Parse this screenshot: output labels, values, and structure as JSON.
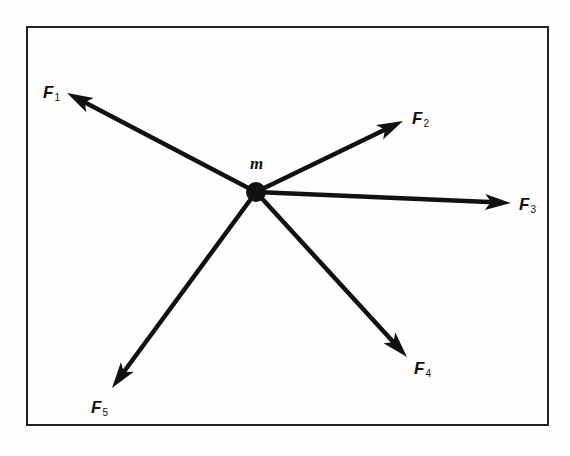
{
  "diagram": {
    "type": "force-diagram",
    "frame": {
      "left": 27,
      "top": 27,
      "right": 548,
      "bottom": 425
    },
    "mass": {
      "label": "m",
      "center": [
        256,
        192
      ],
      "radius": 10
    },
    "forces": [
      {
        "id": "F1",
        "symbol": "F",
        "subscript": "1",
        "tip": [
          67,
          93
        ],
        "label_pos": [
          43,
          84
        ]
      },
      {
        "id": "F2",
        "symbol": "F",
        "subscript": "2",
        "tip": [
          403,
          121
        ],
        "label_pos": [
          412,
          110
        ]
      },
      {
        "id": "F3",
        "symbol": "F",
        "subscript": "3",
        "tip": [
          511,
          203
        ],
        "label_pos": [
          519,
          196
        ]
      },
      {
        "id": "F4",
        "symbol": "F",
        "subscript": "4",
        "tip": [
          407,
          357
        ],
        "label_pos": [
          414,
          360
        ]
      },
      {
        "id": "F5",
        "symbol": "F",
        "subscript": "5",
        "tip": [
          112,
          388
        ],
        "label_pos": [
          91,
          399
        ]
      }
    ],
    "colors": {
      "ink": "#111111",
      "frame": "#222222",
      "background": "#fdfdfd"
    }
  }
}
